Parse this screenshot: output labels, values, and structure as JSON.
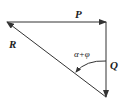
{
  "diagram": {
    "title": "",
    "labels": {
      "P": "P",
      "Q": "Q",
      "R": "R",
      "angle": "α+φ"
    },
    "colors": {
      "line": "#333333",
      "background": "#ffffff"
    },
    "vectors": [
      {
        "name": "P",
        "from": [
          7,
          22
        ],
        "to": [
          106,
          22
        ]
      },
      {
        "name": "Q",
        "from": [
          106,
          22
        ],
        "to": [
          106,
          97
        ]
      },
      {
        "name": "R",
        "from": [
          106,
          97
        ],
        "to": [
          7,
          22
        ]
      }
    ]
  }
}
